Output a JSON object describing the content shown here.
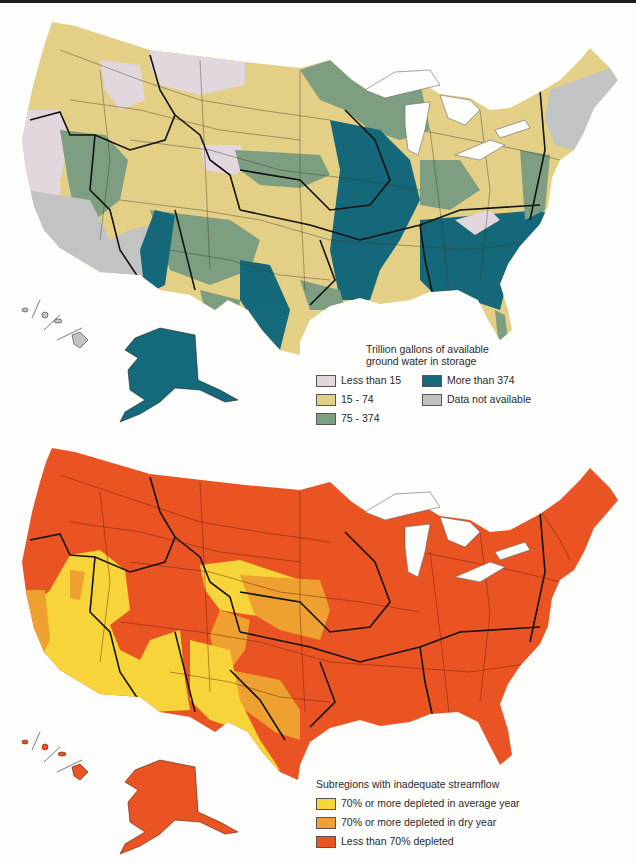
{
  "maps": [
    {
      "id": "groundwater",
      "legend": {
        "title_line1": "Trillion gallons of available",
        "title_line2": "ground water in storage",
        "items": [
          {
            "label": "Less than 15",
            "color": "#e2d7dc"
          },
          {
            "label": "15 - 74",
            "color": "#e3cf86"
          },
          {
            "label": "75 - 374",
            "color": "#7e9e80"
          },
          {
            "label": "More than 374",
            "color": "#14697a"
          },
          {
            "label": "Data not available",
            "color": "#c2c4c4"
          }
        ]
      }
    },
    {
      "id": "streamflow",
      "legend": {
        "title": "Subregions with inadequate streamflow",
        "items": [
          {
            "label": "70% or more depleted in average year",
            "color": "#f7d43a"
          },
          {
            "label": "70% or more depleted in dry year",
            "color": "#eea031"
          },
          {
            "label": "Less than 70% depleted",
            "color": "#ea5424"
          }
        ]
      }
    }
  ]
}
